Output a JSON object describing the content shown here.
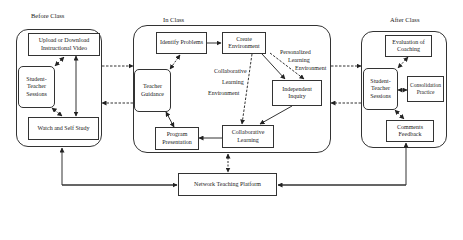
{
  "diagram": {
    "type": "flowchart",
    "sections": {
      "before": {
        "label": "Before Class",
        "nodes": {
          "upload": "Upload or Download Instructional Video",
          "sessions": "Student-Teacher Sessions",
          "watch": "Watch and Self Study"
        }
      },
      "in": {
        "label": "In Class",
        "nodes": {
          "identify": "Identify Problems",
          "create": "Create Environment",
          "guidance": "Teacher Guidance",
          "inquiry": "Independent Inquiry",
          "presentation": "Program Presentation",
          "collab": "Collaborative Learning"
        },
        "annotations": {
          "collab_env_1": "Collaborative",
          "collab_env_2": "Learning",
          "collab_env_3": "Environment",
          "personal_env_1": "Personalized",
          "personal_env_2": "Learning",
          "personal_env_3": "Environment"
        }
      },
      "after": {
        "label": "After Class",
        "nodes": {
          "evaluation": "Evaluation of Coaching",
          "sessions": "Student-Teacher Sessions",
          "consolidation": "Consolidation Practice",
          "feedback": "Comments Feedback"
        }
      }
    },
    "platform": "Network Teaching Platform",
    "edges": [
      {
        "from": "Upload or Download Instructional Video",
        "to": "Student-Teacher Sessions (Before)",
        "style": "dashed",
        "dir": "both"
      },
      {
        "from": "Upload or Download Instructional Video",
        "to": "Watch and Self Study",
        "style": "solid",
        "dir": "both"
      },
      {
        "from": "Student-Teacher Sessions (Before)",
        "to": "Watch and Self Study",
        "style": "dashed",
        "dir": "both"
      },
      {
        "from": "Before Class",
        "to": "In Class",
        "style": "dashed",
        "dir": "forward"
      },
      {
        "from": "In Class",
        "to": "Before Class",
        "style": "dashed",
        "dir": "forward"
      },
      {
        "from": "Identify Problems",
        "to": "Create Environment",
        "style": "solid",
        "dir": "forward"
      },
      {
        "from": "Identify Problems",
        "to": "Teacher Guidance",
        "style": "dashed",
        "dir": "both"
      },
      {
        "from": "Create Environment",
        "to": "Collaborative Learning",
        "style": "dashed",
        "dir": "forward",
        "label": "Collaborative Learning Environment"
      },
      {
        "from": "Create Environment",
        "to": "Independent Inquiry",
        "style": "solid",
        "dir": "forward"
      },
      {
        "from": "Create Environment",
        "to": "Independent Inquiry",
        "style": "dashed",
        "dir": "forward",
        "label": "Personalized Learning Environment"
      },
      {
        "from": "Independent Inquiry",
        "to": "Collaborative Learning",
        "style": "solid",
        "dir": "forward"
      },
      {
        "from": "Collaborative Learning",
        "to": "Program Presentation",
        "style": "solid",
        "dir": "forward"
      },
      {
        "from": "Teacher Guidance",
        "to": "Program Presentation",
        "style": "solid",
        "dir": "both"
      },
      {
        "from": "In Class",
        "to": "After Class",
        "style": "dashed",
        "dir": "forward"
      },
      {
        "from": "After Class",
        "to": "In Class",
        "style": "dashed",
        "dir": "forward"
      },
      {
        "from": "Evaluation of Coaching",
        "to": "Student-Teacher Sessions (After)",
        "style": "dashed",
        "dir": "both"
      },
      {
        "from": "Student-Teacher Sessions (After)",
        "to": "Consolidation Practice",
        "style": "solid",
        "dir": "both"
      },
      {
        "from": "Student-Teacher Sessions (After)",
        "to": "Comments Feedback",
        "style": "dashed",
        "dir": "both"
      },
      {
        "from": "In Class",
        "to": "Network Teaching Platform",
        "style": "dashed",
        "dir": "both"
      },
      {
        "from": "Network Teaching Platform",
        "to": "Watch and Self Study",
        "style": "solid",
        "dir": "both"
      },
      {
        "from": "Network Teaching Platform",
        "to": "Comments Feedback",
        "style": "solid",
        "dir": "both"
      }
    ]
  }
}
